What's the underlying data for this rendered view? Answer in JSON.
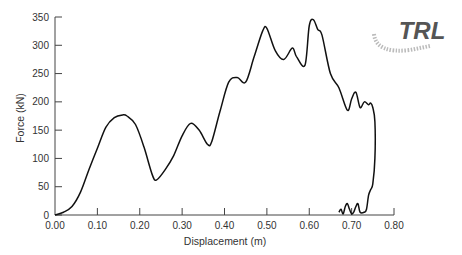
{
  "chart_data": {
    "type": "line",
    "title": "",
    "xlabel": "Displacement (m)",
    "ylabel": "Force (kN)",
    "xlim": [
      0.0,
      0.8
    ],
    "ylim": [
      0,
      350
    ],
    "xticks": [
      "0.00",
      "0.10",
      "0.20",
      "0.30",
      "0.40",
      "0.50",
      "0.60",
      "0.70",
      "0.80"
    ],
    "yticks": [
      "0",
      "50",
      "100",
      "150",
      "200",
      "250",
      "300",
      "350"
    ],
    "grid": false,
    "legend": null,
    "series": [
      {
        "name": "Force-displacement",
        "x": [
          0.0,
          0.02,
          0.04,
          0.06,
          0.08,
          0.1,
          0.12,
          0.14,
          0.16,
          0.17,
          0.19,
          0.21,
          0.23,
          0.24,
          0.26,
          0.28,
          0.3,
          0.32,
          0.34,
          0.36,
          0.37,
          0.39,
          0.41,
          0.43,
          0.45,
          0.47,
          0.49,
          0.5,
          0.52,
          0.54,
          0.56,
          0.57,
          0.59,
          0.6,
          0.61,
          0.62,
          0.63,
          0.65,
          0.67,
          0.69,
          0.7,
          0.71,
          0.72,
          0.73,
          0.74,
          0.745,
          0.75,
          0.755,
          0.755,
          0.75,
          0.745,
          0.74,
          0.735,
          0.73,
          0.72,
          0.715,
          0.71,
          0.705,
          0.7,
          0.695,
          0.69,
          0.685,
          0.68,
          0.675,
          0.67
        ],
        "y": [
          0,
          5,
          15,
          40,
          80,
          118,
          155,
          172,
          177,
          175,
          160,
          120,
          70,
          62,
          80,
          105,
          140,
          162,
          150,
          125,
          130,
          185,
          235,
          243,
          235,
          280,
          325,
          330,
          290,
          275,
          295,
          280,
          265,
          335,
          345,
          328,
          318,
          250,
          225,
          185,
          205,
          217,
          190,
          200,
          195,
          198,
          190,
          165,
          100,
          55,
          45,
          35,
          10,
          5,
          5,
          20,
          15,
          5,
          2,
          10,
          20,
          15,
          2,
          10,
          5
        ]
      }
    ],
    "annotations": [
      "TRL logo (top right)"
    ]
  },
  "logo": {
    "text": "TRL"
  }
}
